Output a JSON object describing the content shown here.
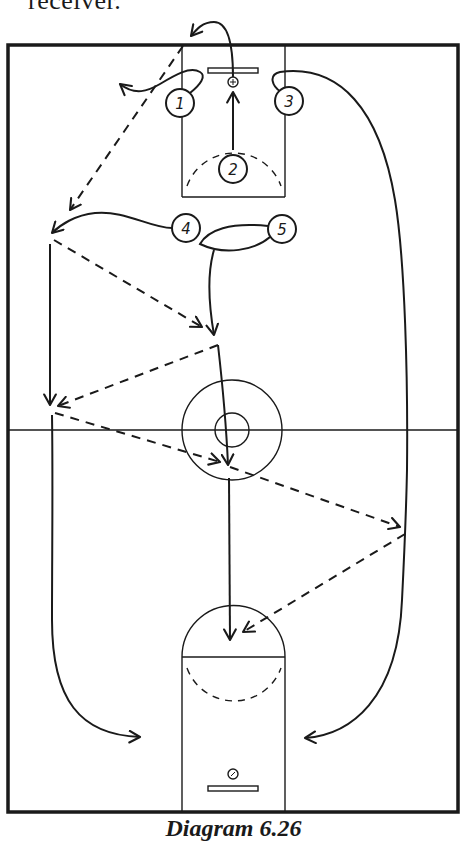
{
  "page": {
    "top_text": "receiver.",
    "caption": "Diagram 6.26"
  },
  "diagram": {
    "type": "basketball-play-diagram",
    "colors": {
      "ink": "#1a1a1a",
      "background": "#ffffff"
    },
    "court": {
      "outer": {
        "x": 8,
        "y": 45,
        "w": 450,
        "h": 767
      },
      "half_court_y": 430,
      "center_circle": {
        "cx": 232,
        "cy": 430,
        "r_outer": 50,
        "r_inner": 17
      }
    },
    "players": [
      {
        "id": "1",
        "label": "1",
        "cx": 180,
        "cy": 103
      },
      {
        "id": "2",
        "label": "2",
        "cx": 233,
        "cy": 169
      },
      {
        "id": "3",
        "label": "3",
        "cx": 289,
        "cy": 101
      },
      {
        "id": "4",
        "label": "4",
        "cx": 186,
        "cy": 228
      },
      {
        "id": "5",
        "label": "5",
        "cx": 282,
        "cy": 229
      }
    ],
    "legend": {
      "solid_line": "player movement",
      "dashed_line": "pass"
    }
  }
}
